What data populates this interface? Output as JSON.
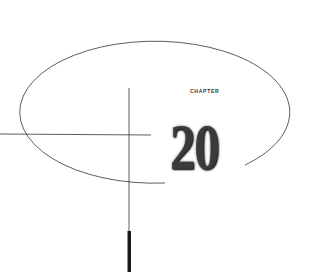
{
  "chapter": {
    "label": "CHAPTER",
    "number": "20"
  },
  "colors": {
    "background": "#ffffff",
    "line": "#333333",
    "number": "#3a3a3a"
  }
}
